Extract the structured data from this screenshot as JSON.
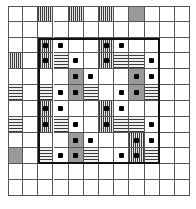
{
  "figure": {
    "type": "lattice-grid-diagram",
    "caption": "",
    "grid": {
      "rows": 12,
      "columns": 12,
      "cell_width": 15.17,
      "cell_height": 15.83,
      "line_color": "#555555",
      "background": "#ffffff"
    },
    "legend": {
      "blank": "empty cell",
      "solid": "solid gray cell",
      "vstripe": "vertical hatched cell",
      "hstripe": "horizontal hatched cell",
      "dot": "black square marker"
    },
    "highlight_box": {
      "label": "bold-region",
      "color": "#111111",
      "start_row": 3,
      "end_row": 10,
      "start_col": 3,
      "end_col": 10
    }
  },
  "chart_data": {
    "type": "heatmap",
    "title": "",
    "xlabel": "",
    "ylabel": "",
    "rows": 12,
    "columns": 12,
    "fill_codes": {
      "0": "blank",
      "1": "solid",
      "2": "vstripe",
      "3": "hstripe"
    },
    "fills": [
      [
        0,
        0,
        2,
        0,
        2,
        0,
        2,
        0,
        1,
        0,
        0,
        0
      ],
      [
        0,
        0,
        0,
        0,
        0,
        0,
        0,
        0,
        0,
        0,
        0,
        0
      ],
      [
        0,
        0,
        2,
        0,
        0,
        0,
        2,
        0,
        0,
        0,
        0,
        0
      ],
      [
        2,
        0,
        2,
        3,
        0,
        0,
        2,
        3,
        3,
        0,
        0,
        0
      ],
      [
        0,
        0,
        0,
        0,
        1,
        0,
        0,
        0,
        1,
        0,
        0,
        0
      ],
      [
        3,
        0,
        3,
        0,
        1,
        3,
        0,
        0,
        1,
        3,
        0,
        0
      ],
      [
        0,
        0,
        2,
        0,
        0,
        0,
        2,
        0,
        0,
        0,
        0,
        0
      ],
      [
        3,
        0,
        2,
        3,
        0,
        0,
        2,
        3,
        3,
        0,
        0,
        0
      ],
      [
        0,
        0,
        0,
        0,
        1,
        0,
        0,
        0,
        2,
        0,
        0,
        0
      ],
      [
        1,
        0,
        3,
        0,
        1,
        3,
        0,
        0,
        2,
        3,
        0,
        0
      ],
      [
        0,
        0,
        0,
        0,
        0,
        0,
        0,
        0,
        0,
        0,
        0,
        0
      ],
      [
        0,
        0,
        0,
        0,
        0,
        0,
        0,
        0,
        0,
        0,
        0,
        0
      ]
    ],
    "dots": [
      [
        0,
        0,
        0,
        0,
        0,
        0,
        0,
        0,
        0,
        0,
        0,
        0
      ],
      [
        0,
        0,
        0,
        0,
        0,
        0,
        0,
        0,
        0,
        0,
        0,
        0
      ],
      [
        0,
        0,
        1,
        1,
        0,
        0,
        1,
        1,
        0,
        0,
        0,
        0
      ],
      [
        0,
        0,
        1,
        0,
        1,
        0,
        1,
        0,
        0,
        1,
        0,
        0
      ],
      [
        0,
        0,
        0,
        0,
        1,
        1,
        0,
        0,
        1,
        1,
        0,
        0
      ],
      [
        0,
        0,
        0,
        1,
        1,
        0,
        0,
        1,
        1,
        0,
        0,
        0
      ],
      [
        0,
        0,
        1,
        1,
        0,
        0,
        1,
        1,
        0,
        0,
        0,
        0
      ],
      [
        0,
        0,
        1,
        0,
        1,
        0,
        1,
        0,
        0,
        1,
        0,
        0
      ],
      [
        0,
        0,
        0,
        0,
        1,
        1,
        0,
        0,
        1,
        1,
        0,
        0
      ],
      [
        0,
        0,
        0,
        1,
        1,
        0,
        0,
        1,
        1,
        0,
        0,
        0
      ],
      [
        0,
        0,
        0,
        0,
        0,
        0,
        0,
        0,
        0,
        0,
        0,
        0
      ],
      [
        0,
        0,
        0,
        0,
        0,
        0,
        0,
        0,
        0,
        0,
        0,
        0
      ]
    ]
  }
}
